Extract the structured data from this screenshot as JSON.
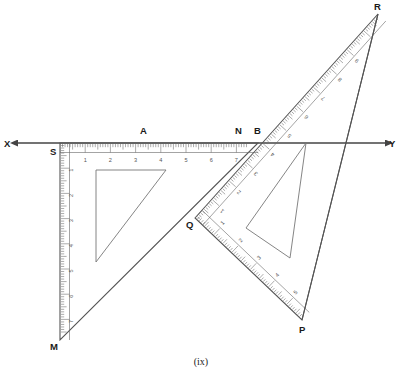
{
  "figure": {
    "caption": "(ix)",
    "colors": {
      "ink": "#333333",
      "ruler_edge": "#555555",
      "tick": "#666666",
      "axis": "#444444",
      "label": "#1a1a1a",
      "background": "#ffffff"
    },
    "axis": {
      "name": "line-XY",
      "left_label": "X",
      "right_label": "Y",
      "left_arrow": true,
      "right_arrow": true,
      "y": 143,
      "x_start": 18,
      "x_end": 386
    },
    "points": [
      {
        "id": "X",
        "label": "X",
        "x": 10,
        "y": 143,
        "tx": 4,
        "ty": 147
      },
      {
        "id": "Y",
        "label": "Y",
        "x": 392,
        "y": 143,
        "tx": 389,
        "ty": 147
      },
      {
        "id": "S",
        "label": "S",
        "x": 60,
        "y": 143,
        "tx": 50,
        "ty": 155
      },
      {
        "id": "A",
        "label": "A",
        "x": 144,
        "y": 143,
        "tx": 140,
        "ty": 134
      },
      {
        "id": "N",
        "label": "N",
        "x": 239,
        "y": 143,
        "tx": 235,
        "ty": 134
      },
      {
        "id": "B",
        "label": "B",
        "x": 258,
        "y": 143,
        "tx": 254,
        "ty": 134
      },
      {
        "id": "M",
        "label": "M",
        "x": 60,
        "y": 340,
        "tx": 50,
        "ty": 350
      },
      {
        "id": "Q",
        "label": "Q",
        "x": 195,
        "y": 218,
        "tx": 186,
        "ty": 228
      },
      {
        "id": "P",
        "label": "P",
        "x": 302,
        "y": 320,
        "tx": 299,
        "ty": 333
      },
      {
        "id": "R",
        "label": "R",
        "x": 378,
        "y": 14,
        "tx": 374,
        "ty": 10
      }
    ],
    "set_squares": [
      {
        "name": "left-set-square",
        "vertices": [
          "S",
          "M",
          "B"
        ],
        "right_angle_at": "S",
        "rulers": [
          {
            "name": "horizontal-ruler-SB",
            "numbers": [
              1,
              2,
              3,
              4,
              5,
              6,
              7
            ],
            "orientation": "horizontal"
          },
          {
            "name": "vertical-ruler-SM",
            "numbers": [
              1,
              2,
              3,
              4,
              5,
              6,
              7
            ],
            "orientation": "vertical"
          }
        ],
        "cutout": "inner-triangle"
      },
      {
        "name": "right-set-square",
        "vertices": [
          "Q",
          "P",
          "R"
        ],
        "right_angle_at": "Q",
        "rulers": [
          {
            "name": "ruler-QR",
            "numbers": [
              1,
              2,
              3,
              4,
              5,
              6,
              7,
              8,
              9
            ],
            "orientation": "diagonal-up"
          },
          {
            "name": "ruler-QP",
            "numbers": [
              1,
              2,
              3,
              4,
              5,
              6,
              7
            ],
            "orientation": "diagonal-down"
          }
        ],
        "cutout": "inner-triangle"
      }
    ]
  }
}
